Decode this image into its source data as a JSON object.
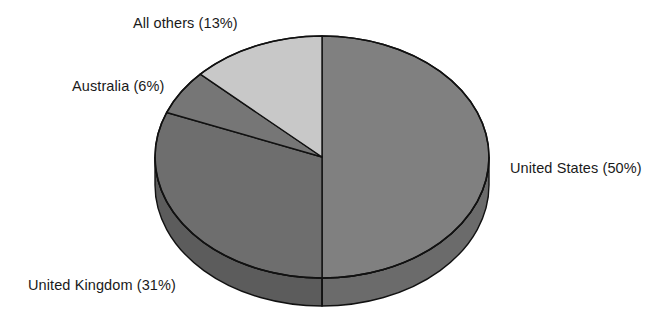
{
  "chart_data": {
    "type": "pie",
    "title": "",
    "subtitle": "",
    "xlabel": "",
    "ylabel": "",
    "legend_position": "none",
    "grid": false,
    "three_d": true,
    "start_angle_deg": 0,
    "direction": "clockwise",
    "categories": [
      "United States",
      "United Kingdom",
      "Australia",
      "All others"
    ],
    "values": [
      50,
      31,
      6,
      13
    ],
    "units": "percent",
    "total": 100,
    "slices": [
      {
        "name": "United States",
        "value": 50,
        "label": "United States (50%)",
        "color": "#808080",
        "side_color": "#6b6b6b",
        "label_position": "right"
      },
      {
        "name": "United Kingdom",
        "value": 31,
        "label": "United Kingdom (31%)",
        "color": "#6e6e6e",
        "side_color": "#5c5c5c",
        "label_position": "bottom-left"
      },
      {
        "name": "Australia",
        "value": 6,
        "label": "Australia (6%)",
        "color": "#767676",
        "side_color": "#636363",
        "label_position": "left"
      },
      {
        "name": "All others",
        "value": 13,
        "label": "All others (13%)",
        "color": "#c8c8c8",
        "side_color": "#a8a8a8",
        "label_position": "top-left"
      }
    ]
  },
  "style": {
    "background": "#ffffff",
    "outline": "#111111",
    "text_color": "#1a1a1a"
  }
}
